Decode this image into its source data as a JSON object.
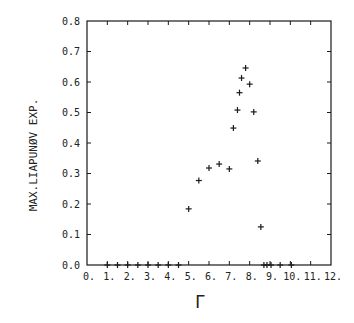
{
  "chart_data": {
    "type": "scatter",
    "title": "",
    "xlabel": "Γ",
    "ylabel": "MAX.LIAPUNØV EXP.",
    "xlim": [
      0,
      12
    ],
    "ylim": [
      0.0,
      0.8
    ],
    "grid": false,
    "legend": null,
    "marker": "+",
    "x_ticks": [
      "0.",
      "1.",
      "2.",
      "3.",
      "4.",
      "5.",
      "6.",
      "7.",
      "8.",
      "9.",
      "10.",
      "11.",
      "12."
    ],
    "y_ticks": [
      "0.0",
      "0.1",
      "0.2",
      "0.3",
      "0.4",
      "0.5",
      "0.6",
      "0.7",
      "0.8"
    ],
    "series": [
      {
        "name": "max Liapunov exponent",
        "points": [
          {
            "x": 1.0,
            "y": 0.0
          },
          {
            "x": 1.5,
            "y": 0.0
          },
          {
            "x": 2.0,
            "y": 0.0
          },
          {
            "x": 2.5,
            "y": 0.0
          },
          {
            "x": 3.0,
            "y": 0.0
          },
          {
            "x": 3.5,
            "y": 0.0
          },
          {
            "x": 4.0,
            "y": 0.0
          },
          {
            "x": 4.5,
            "y": 0.0
          },
          {
            "x": 5.0,
            "y": 0.184
          },
          {
            "x": 5.5,
            "y": 0.277
          },
          {
            "x": 6.0,
            "y": 0.318
          },
          {
            "x": 6.5,
            "y": 0.331
          },
          {
            "x": 7.0,
            "y": 0.315
          },
          {
            "x": 7.2,
            "y": 0.449
          },
          {
            "x": 7.4,
            "y": 0.508
          },
          {
            "x": 7.5,
            "y": 0.565
          },
          {
            "x": 7.6,
            "y": 0.613
          },
          {
            "x": 7.8,
            "y": 0.646
          },
          {
            "x": 8.0,
            "y": 0.593
          },
          {
            "x": 8.2,
            "y": 0.502
          },
          {
            "x": 8.4,
            "y": 0.341
          },
          {
            "x": 8.55,
            "y": 0.125
          },
          {
            "x": 8.7,
            "y": 0.0
          },
          {
            "x": 8.85,
            "y": 0.0
          },
          {
            "x": 9.05,
            "y": 0.0
          },
          {
            "x": 9.5,
            "y": 0.0
          },
          {
            "x": 10.05,
            "y": 0.0
          }
        ]
      }
    ]
  },
  "layout": {
    "plot_left": 87,
    "plot_top": 21,
    "plot_right": 331,
    "plot_bottom": 265,
    "color": "#1a1a1a"
  }
}
